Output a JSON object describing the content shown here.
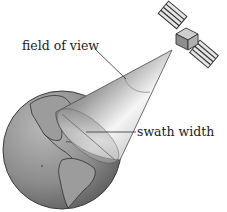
{
  "diagram": {
    "labels": {
      "field_of_view": "field of view",
      "swath_width": "swath width"
    },
    "elements": {
      "satellite": "satellite-icon",
      "earth": "globe-icon",
      "cone": "field-of-view-cone"
    },
    "colors": {
      "background": "#ffffff",
      "text": "#222222",
      "globe_base": "#8a8a8a",
      "cone_light": "#f4f4f4",
      "cone_dark": "#6e6e6e",
      "leader_line": "#444444"
    }
  }
}
